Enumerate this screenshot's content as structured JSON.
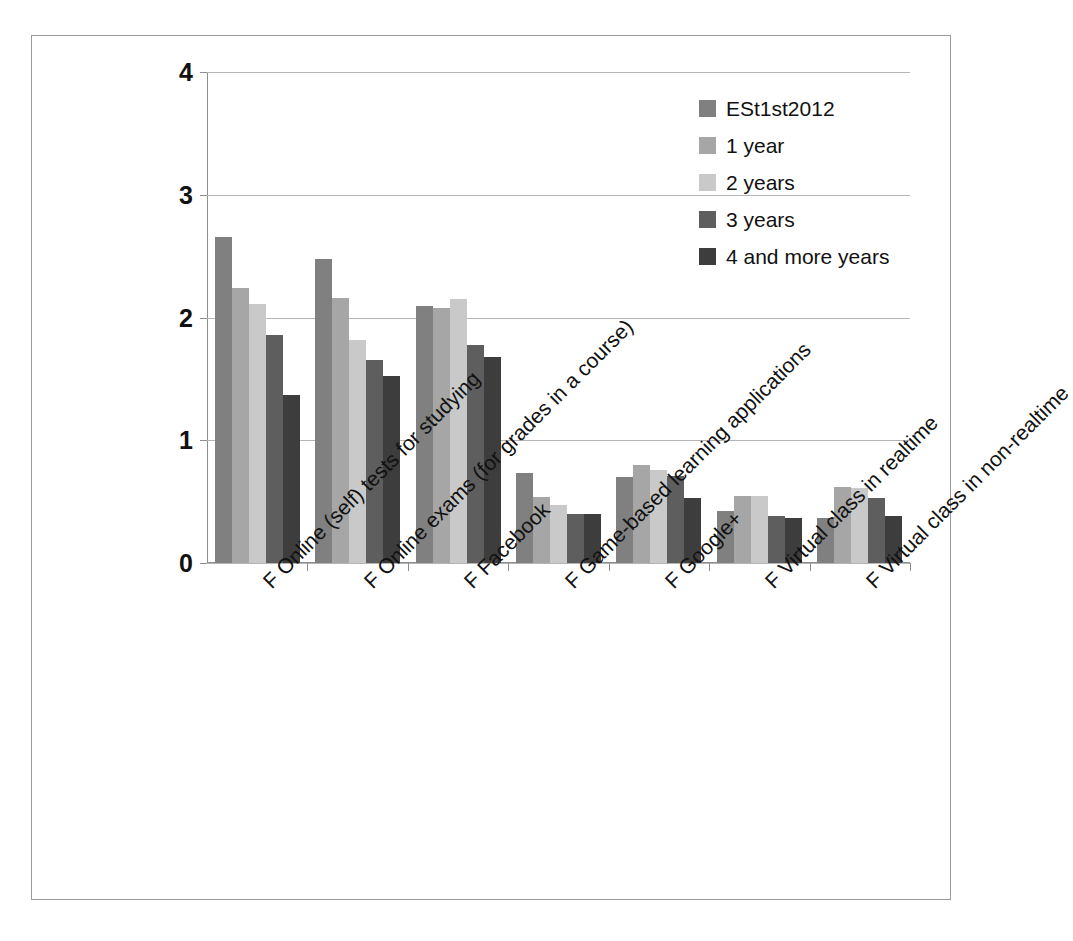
{
  "chart_data": {
    "type": "bar",
    "title": "",
    "xlabel": "",
    "ylabel": "",
    "ylim": [
      0,
      4
    ],
    "yticks": [
      0,
      1,
      2,
      3,
      4
    ],
    "ytick_labels": [
      "0",
      "1",
      "2",
      "3",
      "4"
    ],
    "grid": true,
    "legend_position": "top-right",
    "categories": [
      "F Online (self) tests for studying",
      "F Online exams (for grades in a course)",
      "F Facebook",
      "F Game-based learning applications",
      "F Google+",
      "F Virtual class in realtime",
      "F Virtual class in non-realtime"
    ],
    "series": [
      {
        "name": "ESt1st2012",
        "color": "#808080",
        "values": [
          2.66,
          2.48,
          2.09,
          0.73,
          0.7,
          0.42,
          0.37
        ]
      },
      {
        "name": "1 year",
        "color": "#a6a6a6",
        "values": [
          2.24,
          2.16,
          2.08,
          0.54,
          0.8,
          0.55,
          0.62
        ]
      },
      {
        "name": "2 years",
        "color": "#c9c9c9",
        "values": [
          2.11,
          1.82,
          2.15,
          0.47,
          0.76,
          0.55,
          0.61
        ]
      },
      {
        "name": "3 years",
        "color": "#5e5e5e",
        "values": [
          1.86,
          1.65,
          1.78,
          0.4,
          0.71,
          0.38,
          0.53
        ]
      },
      {
        "name": "4 and more years",
        "color": "#3d3d3d",
        "values": [
          1.37,
          1.52,
          1.68,
          0.4,
          0.53,
          0.37,
          0.38
        ]
      }
    ]
  },
  "colors": {
    "frame_border": "#9a9a9a",
    "gridline": "#b4b4b4",
    "axis": "#8e8e8e",
    "text": "#111111",
    "background": "#ffffff"
  }
}
